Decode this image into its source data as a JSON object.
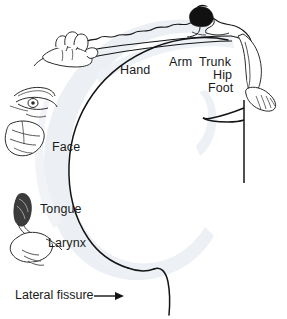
{
  "figure": {
    "kind": "anatomical-diagram",
    "background_color": "#ffffff",
    "ink_color": "#1a1a1a",
    "cortex_shading_color": "#eceff4",
    "hair_color": "#111111"
  },
  "labels": {
    "hand": "Hand",
    "arm": "Arm",
    "trunk": "Trunk",
    "hip": "Hip",
    "foot": "Foot",
    "face": "Face",
    "tongue": "Tongue",
    "larynx": "Larynx",
    "lateral_fissure": "Lateral fissure"
  },
  "annotation": {
    "arrow_glyph": "⟶",
    "arrow_target": "lateral fissure"
  },
  "body_parts_drawn": [
    {
      "name": "fingers-hand",
      "position": "upper-left"
    },
    {
      "name": "eye-face",
      "position": "mid-left"
    },
    {
      "name": "lips-jaw",
      "position": "left"
    },
    {
      "name": "tongue",
      "position": "lower-left"
    },
    {
      "name": "larynx",
      "position": "lower-left"
    },
    {
      "name": "head-torso",
      "position": "top"
    },
    {
      "name": "leg-foot-toes",
      "position": "upper-right"
    }
  ]
}
